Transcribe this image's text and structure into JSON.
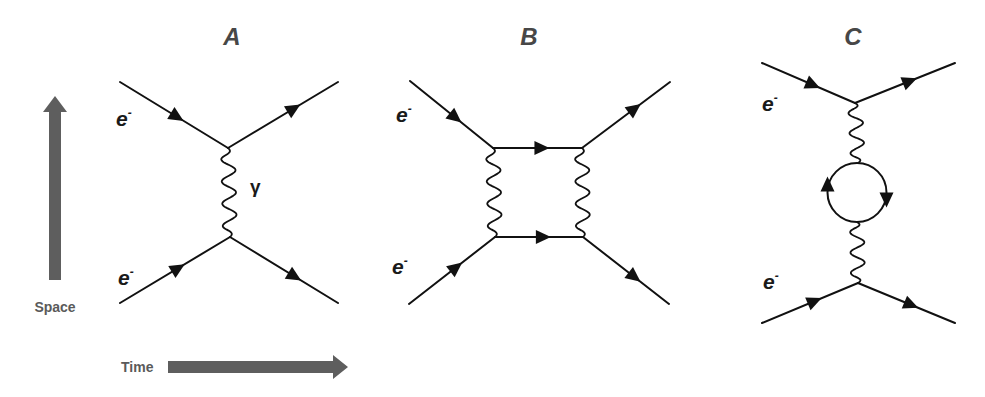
{
  "figure": {
    "axes": {
      "vertical_label": "Space",
      "horizontal_label": "Time"
    },
    "panels": [
      {
        "id": "A",
        "title": "A",
        "incoming_labels": [
          "e",
          "e"
        ],
        "charge_superscript": "-",
        "boson_label": "γ",
        "description": "single photon exchange (tree level)"
      },
      {
        "id": "B",
        "title": "B",
        "incoming_labels": [
          "e",
          "e"
        ],
        "charge_superscript": "-",
        "description": "two-photon exchange (box diagram)"
      },
      {
        "id": "C",
        "title": "C",
        "incoming_labels": [
          "e",
          "e"
        ],
        "charge_superscript": "-",
        "description": "photon exchange with vacuum polarization loop"
      }
    ]
  }
}
